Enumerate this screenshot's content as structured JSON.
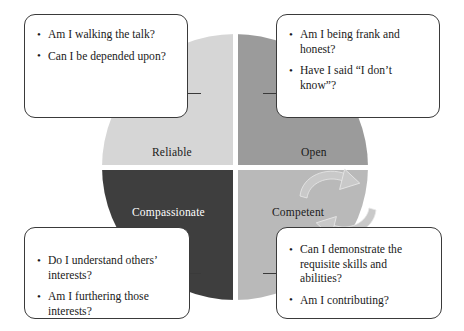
{
  "diagram": {
    "type": "quadrant-circle",
    "colors": {
      "reliable": "#d6d6d6",
      "open": "#9b9b9b",
      "compassionate": "#3e3e3e",
      "competent": "#b9b9b9",
      "outline": "#3a3a3a",
      "arrow": "#c9c9c9",
      "background": "#ffffff"
    },
    "quadrants": [
      {
        "key": "reliable",
        "label": "Reliable",
        "position": "top-left",
        "text_color": "dark",
        "questions": [
          "Am I walking the talk?",
          "Can I be depended upon?"
        ]
      },
      {
        "key": "open",
        "label": "Open",
        "position": "top-right",
        "text_color": "dark",
        "questions": [
          "Am I being frank and honest?",
          "Have I said “I don’t know”?"
        ]
      },
      {
        "key": "compassionate",
        "label": "Compassionate",
        "position": "bottom-left",
        "text_color": "white",
        "questions": [
          "Do I understand others’ interests?",
          "Am I furthering those interests?"
        ]
      },
      {
        "key": "competent",
        "label": "Competent",
        "position": "bottom-right",
        "text_color": "dark",
        "questions": [
          "Can I demonstrate the requisite skills and abilities?",
          "Am I contributing?"
        ]
      }
    ],
    "center_arrows": {
      "name": "cyclical-arrows",
      "count": 2,
      "description": "two curved arrows forming a clockwise cycle"
    }
  }
}
